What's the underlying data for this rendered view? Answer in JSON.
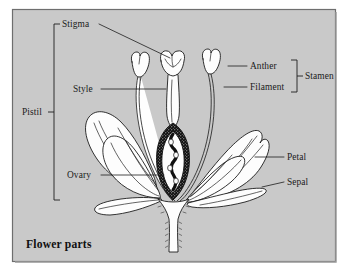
{
  "figure": {
    "title": "Flower parts",
    "background_color": "#c9c9c9",
    "border_color": "#6e6e6e",
    "page_color": "#ffffff",
    "ink_color": "#1b1b1b"
  },
  "labels": {
    "stigma": "Stigma",
    "style": "Style",
    "ovary": "Ovary",
    "pistil": "Pistil",
    "anther": "Anther",
    "filament": "Filament",
    "stamen": "Stamen",
    "petal": "Petal",
    "sepal": "Sepal"
  },
  "groups": {
    "pistil_members": [
      "Stigma",
      "Style",
      "Ovary"
    ],
    "stamen_members": [
      "Anther",
      "Filament"
    ]
  },
  "diagram": {
    "parts": [
      "stigma",
      "style",
      "ovary",
      "ovules",
      "anther",
      "filament",
      "petal",
      "sepal",
      "receptacle",
      "pedicel"
    ]
  }
}
